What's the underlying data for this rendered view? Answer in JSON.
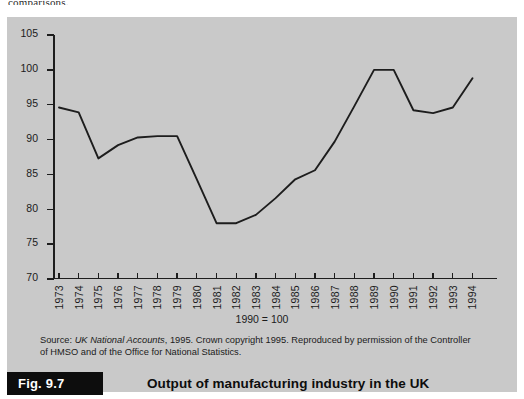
{
  "page": {
    "top_text_fragment": "comparisons."
  },
  "figure": {
    "label": "Fig. 9.7",
    "title": "Output of manufacturing industry in the UK",
    "base_note": "1990 = 100",
    "source_prefix": "Source:",
    "source_italic": "UK National Accounts",
    "source_rest": ", 1995. Crown copyright 1995. Reproduced by permission of the Controller of HMSO and of the Office for National Statistics."
  },
  "colors": {
    "panel_background": "#c9c9c9",
    "line": "#1d1d1d",
    "axis": "#1d1d1d",
    "label_box": "#0d0d0d"
  },
  "chart_data": {
    "type": "line",
    "title": "Output of manufacturing industry in the UK",
    "subtitle": "1990 = 100",
    "xlabel": "",
    "ylabel": "",
    "ylim": [
      70,
      105
    ],
    "yticks": [
      70,
      75,
      80,
      85,
      90,
      95,
      100,
      105
    ],
    "grid": false,
    "legend": false,
    "categories": [
      "1973",
      "1974",
      "1975",
      "1976",
      "1977",
      "1978",
      "1979",
      "1980",
      "1981",
      "1982",
      "1983",
      "1984",
      "1985",
      "1986",
      "1987",
      "1988",
      "1989",
      "1990",
      "1991",
      "1992",
      "1993",
      "1994"
    ],
    "series": [
      {
        "name": "Manufacturing output index",
        "values": [
          94.6,
          93.9,
          87.3,
          89.2,
          90.3,
          90.5,
          90.5,
          84.3,
          78.0,
          78.0,
          79.2,
          81.6,
          84.3,
          85.6,
          89.7,
          94.8,
          100.0,
          100.0,
          94.2,
          93.8,
          94.6,
          98.8
        ]
      }
    ]
  }
}
